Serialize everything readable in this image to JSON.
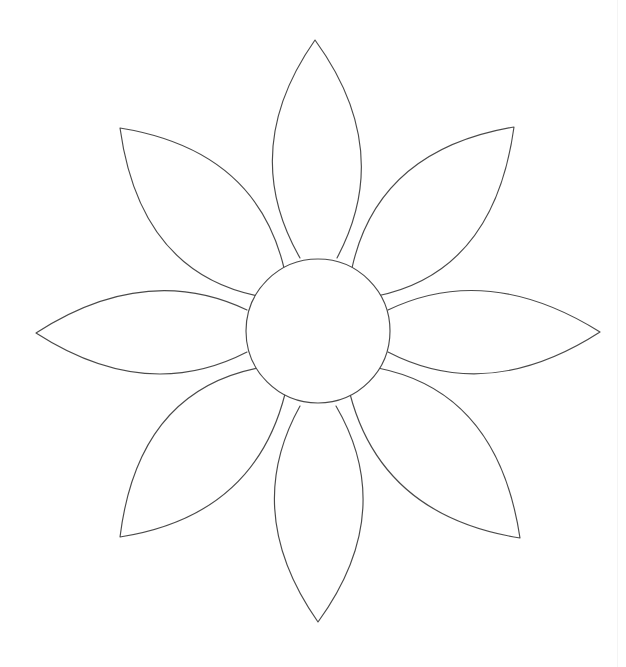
{
  "document": {
    "title": "Flower Outline Template",
    "type": "line-drawing",
    "background_color": "#ffffff",
    "stroke_color": "#4a4a4a",
    "fill_color": "#ffffff",
    "stroke_width": 1.15,
    "canvas": {
      "width": 626,
      "height": 667
    }
  },
  "flower": {
    "name": "eight-petal-flower",
    "center": {
      "cx": 318,
      "cy": 331,
      "r": 72
    },
    "petal_count": 8,
    "petals": [
      {
        "id": "petal-north",
        "label": "Top petal",
        "direction": "N",
        "tip": {
          "x": 315,
          "y": 40
        },
        "base_left": {
          "x": 300,
          "y": 258
        },
        "base_right": {
          "x": 337,
          "y": 258
        },
        "ctrl_left": {
          "x": 238,
          "y": 150
        },
        "ctrl_right": {
          "x": 395,
          "y": 150
        }
      },
      {
        "id": "petal-northeast",
        "label": "Upper-right petal",
        "direction": "NE",
        "tip": {
          "x": 514,
          "y": 127
        },
        "base_left": {
          "x": 352,
          "y": 268
        },
        "base_right": {
          "x": 377,
          "y": 296
        },
        "ctrl_left": {
          "x": 378,
          "y": 150
        },
        "ctrl_right": {
          "x": 494,
          "y": 272
        }
      },
      {
        "id": "petal-east",
        "label": "Right petal",
        "direction": "E",
        "tip": {
          "x": 600,
          "y": 332
        },
        "base_left": {
          "x": 388,
          "y": 310
        },
        "base_right": {
          "x": 388,
          "y": 352
        },
        "ctrl_left": {
          "x": 488,
          "y": 262
        },
        "ctrl_right": {
          "x": 488,
          "y": 404
        }
      },
      {
        "id": "petal-southeast",
        "label": "Lower-right petal",
        "direction": "SE",
        "tip": {
          "x": 520,
          "y": 538
        },
        "base_left": {
          "x": 378,
          "y": 368
        },
        "base_right": {
          "x": 350,
          "y": 394
        },
        "ctrl_left": {
          "x": 498,
          "y": 392
        },
        "ctrl_right": {
          "x": 382,
          "y": 516
        }
      },
      {
        "id": "petal-south",
        "label": "Bottom petal",
        "direction": "S",
        "tip": {
          "x": 318,
          "y": 622
        },
        "base_left": {
          "x": 336,
          "y": 406
        },
        "base_right": {
          "x": 300,
          "y": 406
        },
        "ctrl_left": {
          "x": 398,
          "y": 512
        },
        "ctrl_right": {
          "x": 241,
          "y": 512
        }
      },
      {
        "id": "petal-southwest",
        "label": "Lower-left petal",
        "direction": "SW",
        "tip": {
          "x": 120,
          "y": 537
        },
        "base_left": {
          "x": 285,
          "y": 394
        },
        "base_right": {
          "x": 258,
          "y": 368
        },
        "ctrl_left": {
          "x": 254,
          "y": 516
        },
        "ctrl_right": {
          "x": 138,
          "y": 392
        }
      },
      {
        "id": "petal-west",
        "label": "Left petal",
        "direction": "W",
        "tip": {
          "x": 36,
          "y": 333
        },
        "base_left": {
          "x": 247,
          "y": 352
        },
        "base_right": {
          "x": 247,
          "y": 310
        },
        "ctrl_left": {
          "x": 146,
          "y": 404
        },
        "ctrl_right": {
          "x": 146,
          "y": 262
        }
      },
      {
        "id": "petal-northwest",
        "label": "Upper-left petal",
        "direction": "NW",
        "tip": {
          "x": 120,
          "y": 128
        },
        "base_left": {
          "x": 258,
          "y": 296
        },
        "base_right": {
          "x": 284,
          "y": 268
        },
        "ctrl_left": {
          "x": 140,
          "y": 272
        },
        "ctrl_right": {
          "x": 256,
          "y": 150
        }
      }
    ]
  }
}
